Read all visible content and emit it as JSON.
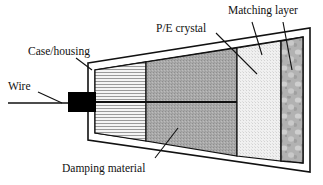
{
  "figure": {
    "type": "cross-section-schematic",
    "background_color": "#ffffff",
    "line_color": "#111111",
    "width": 323,
    "height": 185
  },
  "labels": {
    "case_housing": "Case/housing",
    "pe_crystal": "P/E crystal",
    "matching_layer": "Matching layer",
    "wire": "Wire",
    "damping_material": "Damping material"
  },
  "components": {
    "damping": {
      "name": "Damping material",
      "fill_color": "#f2f2f2",
      "pattern": "horizontal-line-hatch"
    },
    "crystal": {
      "name": "P/E crystal",
      "fill_color": "#a8a8a8",
      "pattern": "fine-dot-texture"
    },
    "lens": {
      "name": "Acoustic lens",
      "fill_color": "#efefef",
      "pattern": "fine-dot-texture"
    },
    "matching": {
      "name": "Matching layer",
      "fill_color": "#b4b4b4",
      "pattern": "mottled-speckle"
    },
    "housing": {
      "name": "Case/housing",
      "fill_color": "#ffffff",
      "wall": "double-line"
    },
    "connector": {
      "name": "Wire connector block",
      "fill_color": "#000000"
    },
    "electrode": {
      "name": "Center electrode line",
      "stroke_color": "#111111"
    }
  }
}
